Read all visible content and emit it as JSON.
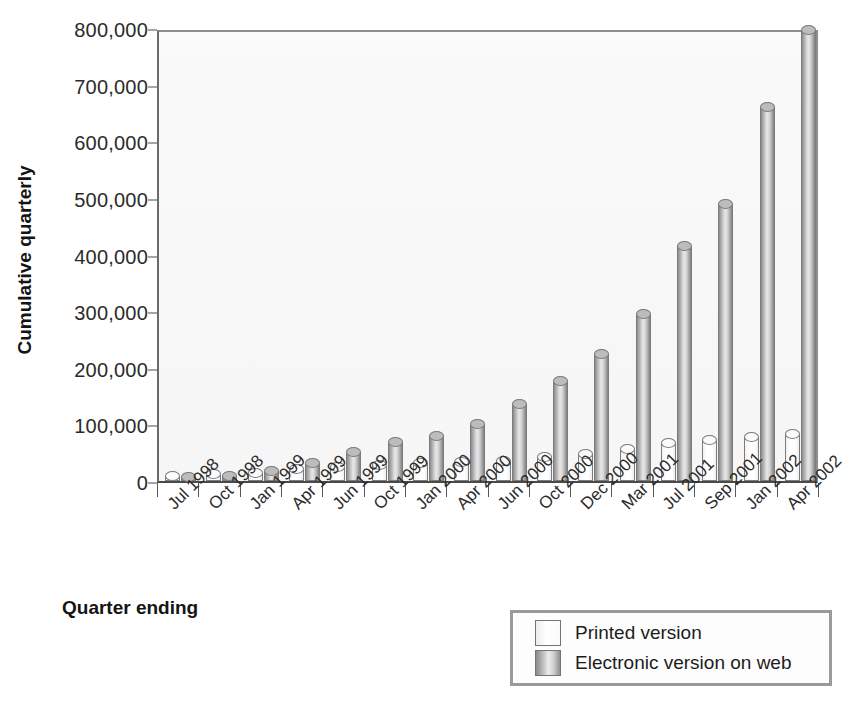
{
  "chart_data": {
    "type": "bar",
    "title": "",
    "xlabel": "Quarter ending",
    "ylabel": "Cumulative quarterly",
    "ylim": [
      0,
      800000
    ],
    "ytick_labels": [
      "0",
      "100,000",
      "200,000",
      "300,000",
      "400,000",
      "500,000",
      "600,000",
      "700,000",
      "800,000"
    ],
    "ytick_values": [
      0,
      100000,
      200000,
      300000,
      400000,
      500000,
      600000,
      700000,
      800000
    ],
    "grid": false,
    "legend_position": "bottom-right",
    "categories": [
      "Jul 1998",
      "Oct 1998",
      "Jan 1999",
      "Apr 1999",
      "Jun 1999",
      "Oct 1999",
      "Jan 2000",
      "Apr 2000",
      "Jun 2000",
      "Oct 2000",
      "Dec 2000",
      "Mar 2001",
      "Jul 2001",
      "Sep 2001",
      "Jan 2002",
      "Apr 2002"
    ],
    "series": [
      {
        "name": "Printed version",
        "color": "#ffffff",
        "values": [
          8000,
          12000,
          15000,
          21000,
          25000,
          29000,
          31000,
          33000,
          36000,
          43000,
          48000,
          56000,
          67000,
          72000,
          78000,
          83000
        ]
      },
      {
        "name": "Electronic version on web",
        "color": "#a8a8a8",
        "values": [
          7000,
          8000,
          17000,
          31000,
          51000,
          69000,
          80000,
          101000,
          136000,
          177000,
          225000,
          295000,
          415000,
          490000,
          661000,
          797000
        ]
      }
    ]
  },
  "legend": {
    "items": [
      {
        "label": "Printed version",
        "swatch": "printed"
      },
      {
        "label": "Electronic version on web",
        "swatch": "web"
      }
    ]
  }
}
